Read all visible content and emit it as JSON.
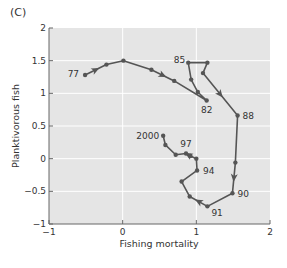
{
  "panel_label": "(C)",
  "colors": {
    "plot_background": "#e5e5e5",
    "gridline": "#ffffff",
    "series_line": "#555555",
    "axis": "#666666",
    "text": "#333333"
  },
  "chart_data": {
    "type": "line",
    "title": "",
    "panel": "(C)",
    "xlabel": "Fishing mortality",
    "ylabel": "Planktivorous fish",
    "xlim": [
      -1,
      2
    ],
    "ylim": [
      -1,
      2
    ],
    "x_ticks": [
      -1,
      0,
      1,
      2
    ],
    "x_tick_labels": [
      "−1",
      "0",
      "1",
      "2"
    ],
    "y_ticks": [
      -1,
      -0.5,
      0,
      0.5,
      1,
      1.5,
      2
    ],
    "y_tick_labels": [
      "−1",
      "−0.5",
      "0",
      "0.5",
      "1",
      "1.5",
      "2"
    ],
    "grid": true,
    "legend": null,
    "series": [
      {
        "name": "Trajectory 1977-2000",
        "connected": true,
        "arrows": true,
        "points": [
          {
            "year": "1977",
            "x": -0.51,
            "y": 1.28,
            "label": "77"
          },
          {
            "year": "1978",
            "x": -0.22,
            "y": 1.44,
            "label": ""
          },
          {
            "year": "1979",
            "x": 0.01,
            "y": 1.5,
            "label": ""
          },
          {
            "year": "1980",
            "x": 0.39,
            "y": 1.36,
            "label": ""
          },
          {
            "year": "1981",
            "x": 0.7,
            "y": 1.19,
            "label": ""
          },
          {
            "year": "1982",
            "x": 1.14,
            "y": 0.89,
            "label": "82"
          },
          {
            "year": "1983",
            "x": 1.02,
            "y": 1.02,
            "label": ""
          },
          {
            "year": "1984",
            "x": 0.93,
            "y": 1.21,
            "label": ""
          },
          {
            "year": "1985",
            "x": 0.89,
            "y": 1.47,
            "label": "85"
          },
          {
            "year": "1986",
            "x": 1.15,
            "y": 1.47,
            "label": ""
          },
          {
            "year": "1987",
            "x": 1.09,
            "y": 1.31,
            "label": ""
          },
          {
            "year": "1988",
            "x": 1.56,
            "y": 0.66,
            "label": "88"
          },
          {
            "year": "1989",
            "x": 1.53,
            "y": -0.06,
            "label": ""
          },
          {
            "year": "1990",
            "x": 1.49,
            "y": -0.53,
            "label": "90"
          },
          {
            "year": "1991",
            "x": 1.15,
            "y": -0.73,
            "label": "91"
          },
          {
            "year": "1992",
            "x": 0.91,
            "y": -0.58,
            "label": ""
          },
          {
            "year": "1993",
            "x": 0.8,
            "y": -0.35,
            "label": ""
          },
          {
            "year": "1994",
            "x": 1.01,
            "y": -0.18,
            "label": "94"
          },
          {
            "year": "1995",
            "x": 1.0,
            "y": 0.0,
            "label": ""
          },
          {
            "year": "1996",
            "x": 0.92,
            "y": 0.04,
            "label": ""
          },
          {
            "year": "1997",
            "x": 0.86,
            "y": 0.08,
            "label": "97"
          },
          {
            "year": "1998",
            "x": 0.72,
            "y": 0.06,
            "label": ""
          },
          {
            "year": "1999",
            "x": 0.58,
            "y": 0.21,
            "label": ""
          },
          {
            "year": "2000",
            "x": 0.55,
            "y": 0.35,
            "label": "2000"
          }
        ]
      }
    ],
    "annotations": [
      "77",
      "82",
      "85",
      "88",
      "90",
      "91",
      "94",
      "97",
      "2000"
    ]
  }
}
